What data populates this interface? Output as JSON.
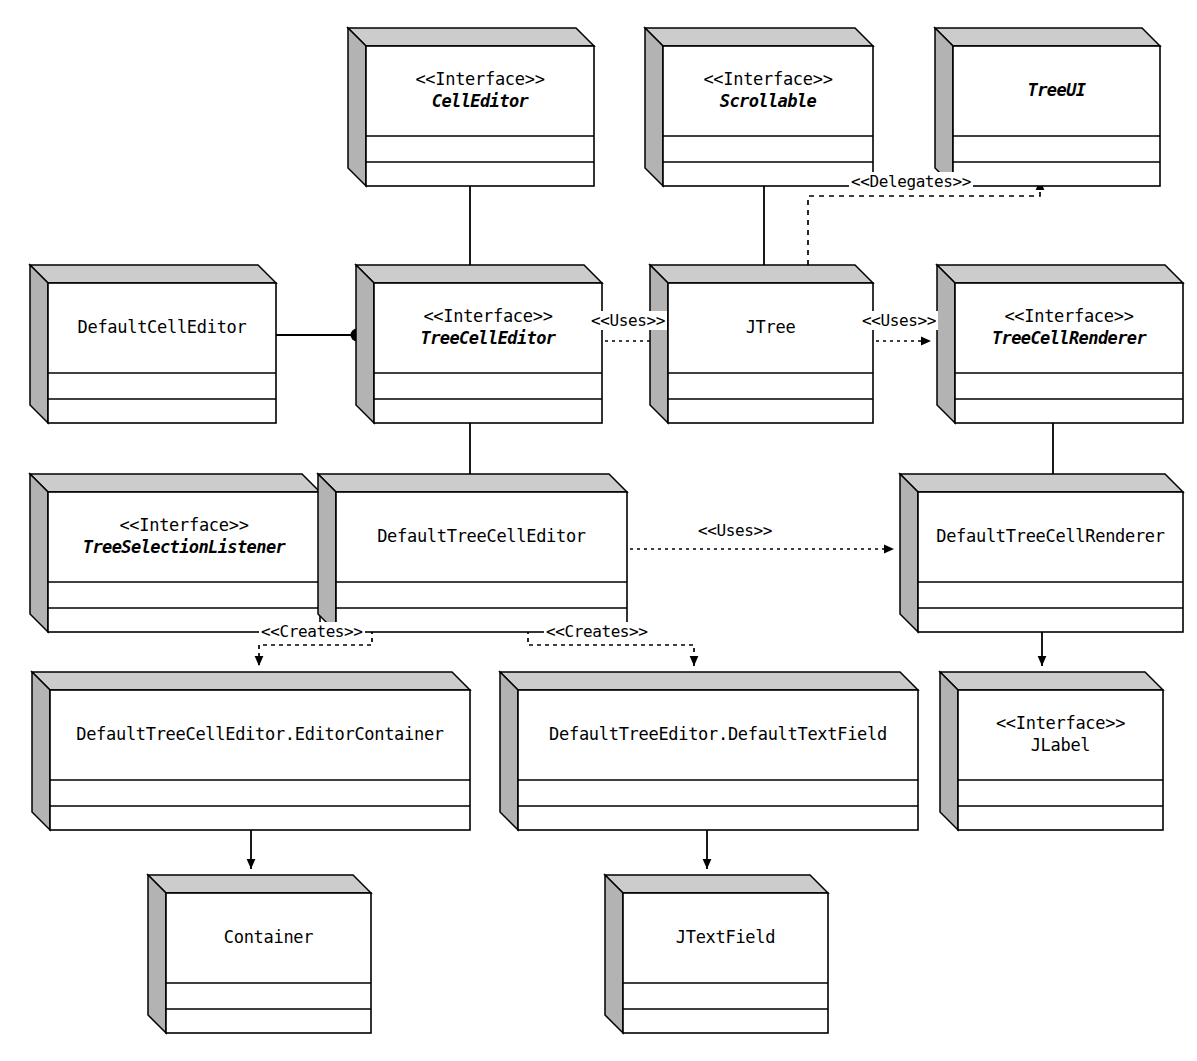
{
  "diagram": {
    "kind": "uml-class-diagram",
    "colors": {
      "line": "#000000",
      "fill": "#ffffff",
      "shade_left": "#b3b3b3",
      "shade_top": "#cccccc",
      "text": "#000000"
    }
  },
  "nodes": [
    {
      "id": "cell-editor",
      "stereotype": "<<Interface>>",
      "name": "CellEditor",
      "italic": true,
      "x": 348,
      "y": 28,
      "w": 228,
      "h": 140
    },
    {
      "id": "scrollable",
      "stereotype": "<<Interface>>",
      "name": "Scrollable",
      "italic": true,
      "x": 645,
      "y": 28,
      "w": 210,
      "h": 140
    },
    {
      "id": "tree-ui",
      "stereotype": "",
      "name": "TreeUI",
      "italic": true,
      "x": 935,
      "y": 28,
      "w": 207,
      "h": 140
    },
    {
      "id": "default-cell-editor",
      "stereotype": "",
      "name": "DefaultCellEditor",
      "italic": false,
      "x": 30,
      "y": 265,
      "w": 228,
      "h": 140
    },
    {
      "id": "tree-cell-editor",
      "stereotype": "<<Interface>>",
      "name": "TreeCellEditor",
      "italic": true,
      "x": 356,
      "y": 265,
      "w": 228,
      "h": 140
    },
    {
      "id": "jtree",
      "stereotype": "",
      "name": "JTree",
      "italic": false,
      "x": 650,
      "y": 265,
      "w": 205,
      "h": 140
    },
    {
      "id": "tree-cell-renderer",
      "stereotype": "<<Interface>>",
      "name": "TreeCellRenderer",
      "italic": true,
      "x": 937,
      "y": 265,
      "w": 228,
      "h": 140
    },
    {
      "id": "tree-selection-listener",
      "stereotype": "<<Interface>>",
      "name": "TreeSelectionListener",
      "italic": true,
      "x": 30,
      "y": 474,
      "w": 272,
      "h": 140
    },
    {
      "id": "default-tree-cell-editor",
      "stereotype": "",
      "name": "DefaultTreeCellEditor",
      "italic": false,
      "x": 318,
      "y": 474,
      "w": 291,
      "h": 140
    },
    {
      "id": "default-tree-cell-renderer",
      "stereotype": "",
      "name": "DefaultTreeCellRenderer",
      "italic": false,
      "x": 900,
      "y": 474,
      "w": 265,
      "h": 140
    },
    {
      "id": "editor-container",
      "stereotype": "",
      "name": "DefaultTreeCellEditor.EditorContainer",
      "italic": false,
      "x": 32,
      "y": 672,
      "w": 420,
      "h": 140
    },
    {
      "id": "default-text-field",
      "stereotype": "",
      "name": "DefaultTreeEditor.DefaultTextField",
      "italic": false,
      "x": 500,
      "y": 672,
      "w": 400,
      "h": 140
    },
    {
      "id": "jlabel",
      "stereotype": "<<Interface>>",
      "name": "JLabel",
      "italic": false,
      "x": 940,
      "y": 672,
      "w": 205,
      "h": 140
    },
    {
      "id": "container",
      "stereotype": "",
      "name": "Container",
      "italic": false,
      "x": 148,
      "y": 875,
      "w": 205,
      "h": 140
    },
    {
      "id": "jtextfield",
      "stereotype": "",
      "name": "JTextField",
      "italic": false,
      "x": 605,
      "y": 875,
      "w": 205,
      "h": 140
    }
  ],
  "edges": [
    {
      "id": "e-tce-extends-ce",
      "from": "tree-cell-editor",
      "to": "cell-editor",
      "style": "solid",
      "head": "open-arrow",
      "label": ""
    },
    {
      "id": "e-jtree-scrollable",
      "from": "jtree",
      "to": "scrollable",
      "style": "solid",
      "head": "ball",
      "label": ""
    },
    {
      "id": "e-jtree-delegates-treeui",
      "from": "jtree",
      "to": "tree-ui",
      "style": "dotted",
      "head": "solid-arrow",
      "label": "<<Delegates>>"
    },
    {
      "id": "e-dce-tce",
      "from": "default-cell-editor",
      "to": "tree-cell-editor",
      "style": "solid",
      "head": "ball",
      "label": ""
    },
    {
      "id": "e-jtree-uses-tce",
      "from": "jtree",
      "to": "tree-cell-editor",
      "style": "dotted",
      "head": "solid-arrow",
      "label": "<<Uses>>"
    },
    {
      "id": "e-jtree-uses-tcr",
      "from": "jtree",
      "to": "tree-cell-renderer",
      "style": "dotted",
      "head": "solid-arrow",
      "label": "<<Uses>>"
    },
    {
      "id": "e-dtce-tce",
      "from": "default-tree-cell-editor",
      "to": "tree-cell-editor",
      "style": "solid",
      "head": "ball",
      "label": ""
    },
    {
      "id": "e-dtcr-tcr",
      "from": "default-tree-cell-renderer",
      "to": "tree-cell-renderer",
      "style": "solid",
      "head": "ball",
      "label": ""
    },
    {
      "id": "e-dtce-tsl",
      "from": "default-tree-cell-editor",
      "to": "tree-selection-listener",
      "style": "solid",
      "head": "ball",
      "label": ""
    },
    {
      "id": "e-dtce-uses-dtcr",
      "from": "default-tree-cell-editor",
      "to": "default-tree-cell-renderer",
      "style": "dotted",
      "head": "solid-arrow",
      "label": "<<Uses>>"
    },
    {
      "id": "e-dtce-creates-container",
      "from": "default-tree-cell-editor",
      "to": "editor-container",
      "style": "dashed",
      "head": "solid-arrow",
      "label": "<<Creates>>"
    },
    {
      "id": "e-dtce-creates-textfield",
      "from": "default-tree-cell-editor",
      "to": "default-text-field",
      "style": "dashed",
      "head": "solid-arrow",
      "label": "<<Creates>>"
    },
    {
      "id": "e-dtcr-jlabel",
      "from": "default-tree-cell-renderer",
      "to": "jlabel",
      "style": "solid",
      "head": "solid-arrow",
      "label": ""
    },
    {
      "id": "e-editorcontainer-container",
      "from": "editor-container",
      "to": "container",
      "style": "solid",
      "head": "solid-arrow",
      "label": ""
    },
    {
      "id": "e-textfield-jtextfield",
      "from": "default-text-field",
      "to": "jtextfield",
      "style": "solid",
      "head": "solid-arrow",
      "label": ""
    }
  ],
  "edge_labels": [
    {
      "id": "lbl-delegates",
      "text": "<<Delegates>>",
      "x": 849,
      "y": 172
    },
    {
      "id": "lbl-uses-editor",
      "text": "<<Uses>>",
      "x": 589,
      "y": 311
    },
    {
      "id": "lbl-uses-renderer",
      "text": "<<Uses>>",
      "x": 860,
      "y": 311
    },
    {
      "id": "lbl-uses-renderer2",
      "text": "<<Uses>>",
      "x": 696,
      "y": 521
    },
    {
      "id": "lbl-creates-1",
      "text": "<<Creates>>",
      "x": 259,
      "y": 622
    },
    {
      "id": "lbl-creates-2",
      "text": "<<Creates>>",
      "x": 544,
      "y": 622
    }
  ]
}
